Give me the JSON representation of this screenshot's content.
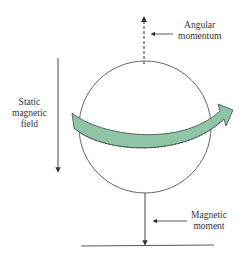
{
  "diagram": {
    "title_clipped": "",
    "labels": {
      "angular_momentum": [
        "Angular",
        "momentum"
      ],
      "static_field": [
        "Static",
        "magnetic",
        "field"
      ],
      "magnetic_moment": [
        "Magnetic",
        "moment"
      ]
    },
    "colors": {
      "line": "#333333",
      "arrow_fill": "#8fc4a6",
      "arrow_stroke": "#3a4a40",
      "circle": "#555555"
    }
  }
}
